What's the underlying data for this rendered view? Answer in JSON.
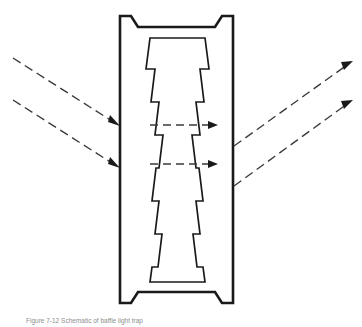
{
  "figure": {
    "caption": "Figure 7-12 Schematic of baffle light trap",
    "background_color": "#ffffff",
    "line_color": "#1a1a1a",
    "ray_color": "#3a3a3a"
  },
  "structure": {
    "name": "vertical-baffle-channel",
    "outer_wall_label": "outer shell",
    "inner_wall_label": "sawtooth cavity",
    "tooth_count_per_side": 7,
    "outer_bounds": {
      "left": 120,
      "right": 233,
      "top": 16,
      "bottom": 303
    },
    "inner_bounds": {
      "left": 143,
      "right": 212,
      "top": 38,
      "bottom": 282
    }
  },
  "rays": {
    "incoming": [
      {
        "id": "incoming-ray-upper",
        "x1": 13,
        "y1": 58,
        "x2": 119,
        "y2": 126
      },
      {
        "id": "incoming-ray-lower",
        "x1": 13,
        "y1": 100,
        "x2": 119,
        "y2": 168
      }
    ],
    "internal": [
      {
        "id": "internal-ray-upper",
        "x1": 150,
        "y1": 125,
        "x2": 216,
        "y2": 125
      },
      {
        "id": "internal-ray-lower",
        "x1": 150,
        "y1": 164,
        "x2": 216,
        "y2": 164
      }
    ],
    "outgoing": [
      {
        "id": "outgoing-ray-upper",
        "x1": 234,
        "y1": 146,
        "x2": 353,
        "y2": 61
      },
      {
        "id": "outgoing-ray-lower",
        "x1": 234,
        "y1": 186,
        "x2": 353,
        "y2": 100
      }
    ]
  }
}
